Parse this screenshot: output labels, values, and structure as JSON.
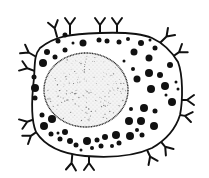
{
  "diagram": {
    "title": "Cell with surface receptors",
    "colors": {
      "ink": "#111111",
      "background": "#ffffff",
      "nucleus_fill": "#f4f4f4",
      "stipple": "#777777"
    },
    "membrane_path": "M40,48 C55,36 70,34 100,33 C125,32 140,33 152,38 C165,44 172,52 178,62 C183,75 183,100 180,115 C176,128 166,140 152,148 C135,156 110,158 85,156 C62,154 45,146 36,132 C30,118 32,95 34,78 C35,64 34,55 40,48 Z",
    "nucleus": {
      "cx": 86,
      "cy": 90,
      "rx": 42,
      "ry": 37
    },
    "receptors": [
      {
        "x": 56,
        "y": 33,
        "angle": -15
      },
      {
        "x": 70,
        "y": 30,
        "angle": 0
      },
      {
        "x": 100,
        "y": 30,
        "angle": 0
      },
      {
        "x": 117,
        "y": 30,
        "angle": 0
      },
      {
        "x": 163,
        "y": 40,
        "angle": 45
      },
      {
        "x": 175,
        "y": 55,
        "angle": 55
      },
      {
        "x": 182,
        "y": 100,
        "angle": 90
      },
      {
        "x": 180,
        "y": 115,
        "angle": 100
      },
      {
        "x": 162,
        "y": 143,
        "angle": 140
      },
      {
        "x": 148,
        "y": 152,
        "angle": 155
      },
      {
        "x": 89,
        "y": 158,
        "angle": 180
      },
      {
        "x": 72,
        "y": 158,
        "angle": 185
      },
      {
        "x": 35,
        "y": 133,
        "angle": 235
      },
      {
        "x": 32,
        "y": 120,
        "angle": 250
      },
      {
        "x": 32,
        "y": 70,
        "angle": 290
      },
      {
        "x": 33,
        "y": 55,
        "angle": 300
      }
    ],
    "granules": [
      {
        "x": 65,
        "y": 35,
        "r": 2.5
      },
      {
        "x": 58,
        "y": 41,
        "r": 2.5
      },
      {
        "x": 73,
        "y": 43,
        "r": 1.5
      },
      {
        "x": 83,
        "y": 43,
        "r": 3.5
      },
      {
        "x": 99,
        "y": 40,
        "r": 2.5
      },
      {
        "x": 107,
        "y": 41,
        "r": 2.5
      },
      {
        "x": 119,
        "y": 42,
        "r": 2.5
      },
      {
        "x": 128,
        "y": 39,
        "r": 2
      },
      {
        "x": 141,
        "y": 43,
        "r": 3
      },
      {
        "x": 150,
        "y": 40,
        "r": 1.5
      },
      {
        "x": 47,
        "y": 52,
        "r": 3
      },
      {
        "x": 55,
        "y": 57,
        "r": 2.5
      },
      {
        "x": 65,
        "y": 50,
        "r": 2.5
      },
      {
        "x": 43,
        "y": 63,
        "r": 4
      },
      {
        "x": 134,
        "y": 52,
        "r": 3.5
      },
      {
        "x": 149,
        "y": 58,
        "r": 3.5
      },
      {
        "x": 155,
        "y": 48,
        "r": 2.5
      },
      {
        "x": 124,
        "y": 61,
        "r": 1.5
      },
      {
        "x": 170,
        "y": 65,
        "r": 3
      },
      {
        "x": 34,
        "y": 77,
        "r": 2.5
      },
      {
        "x": 133,
        "y": 69,
        "r": 2
      },
      {
        "x": 149,
        "y": 73,
        "r": 4
      },
      {
        "x": 160,
        "y": 75,
        "r": 3
      },
      {
        "x": 137,
        "y": 79,
        "r": 3.5
      },
      {
        "x": 165,
        "y": 86,
        "r": 4
      },
      {
        "x": 176,
        "y": 82,
        "r": 1.5
      },
      {
        "x": 35,
        "y": 88,
        "r": 4
      },
      {
        "x": 151,
        "y": 89,
        "r": 4
      },
      {
        "x": 178,
        "y": 89,
        "r": 1.5
      },
      {
        "x": 35,
        "y": 98,
        "r": 2.5
      },
      {
        "x": 166,
        "y": 95,
        "r": 1.5
      },
      {
        "x": 172,
        "y": 102,
        "r": 4
      },
      {
        "x": 131,
        "y": 109,
        "r": 2
      },
      {
        "x": 144,
        "y": 108,
        "r": 4
      },
      {
        "x": 155,
        "y": 111,
        "r": 2.5
      },
      {
        "x": 42,
        "y": 115,
        "r": 2.5
      },
      {
        "x": 52,
        "y": 119,
        "r": 4
      },
      {
        "x": 129,
        "y": 121,
        "r": 4
      },
      {
        "x": 141,
        "y": 121,
        "r": 4
      },
      {
        "x": 154,
        "y": 126,
        "r": 4
      },
      {
        "x": 44,
        "y": 126,
        "r": 4
      },
      {
        "x": 137,
        "y": 130,
        "r": 2
      },
      {
        "x": 51,
        "y": 134,
        "r": 2.5
      },
      {
        "x": 58,
        "y": 133,
        "r": 1.5
      },
      {
        "x": 65,
        "y": 132,
        "r": 3
      },
      {
        "x": 60,
        "y": 139,
        "r": 2.5
      },
      {
        "x": 70,
        "y": 141,
        "r": 3
      },
      {
        "x": 116,
        "y": 135,
        "r": 4
      },
      {
        "x": 130,
        "y": 136,
        "r": 4
      },
      {
        "x": 142,
        "y": 135,
        "r": 2.5
      },
      {
        "x": 105,
        "y": 137,
        "r": 3
      },
      {
        "x": 76,
        "y": 145,
        "r": 2.5
      },
      {
        "x": 87,
        "y": 141,
        "r": 4
      },
      {
        "x": 97,
        "y": 140,
        "r": 2.5
      },
      {
        "x": 101,
        "y": 146,
        "r": 2.5
      },
      {
        "x": 112,
        "y": 146,
        "r": 2
      },
      {
        "x": 92,
        "y": 148,
        "r": 2
      },
      {
        "x": 119,
        "y": 143,
        "r": 2.5
      },
      {
        "x": 81,
        "y": 150,
        "r": 1.5
      }
    ]
  }
}
